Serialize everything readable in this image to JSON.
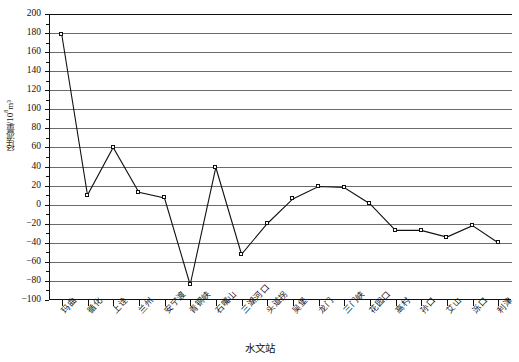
{
  "chart_data": {
    "type": "line",
    "title": "",
    "xlabel": "水文站",
    "ylabel": "径流量/10⁸m³",
    "ylabel_base": "径流量/10",
    "ylabel_exp": "8",
    "ylabel_unit": "m³",
    "ylim": [
      -100,
      200
    ],
    "ytick_step": 20,
    "ytick_labels": [
      "200",
      "180",
      "160",
      "140",
      "120",
      "100",
      "80",
      "60",
      "40",
      "20",
      "0",
      "−20",
      "−40",
      "−60",
      "−80",
      "−100"
    ],
    "grid": true,
    "legend": "none",
    "marker": "open-square",
    "line_color": "#111111",
    "grid_color": "#6b6b6b",
    "categories": [
      "玛曲",
      "循化",
      "上诠",
      "兰州",
      "安宁渡",
      "青铜峡",
      "石嘴山",
      "三湖河口",
      "头道拐",
      "吴堡",
      "龙门",
      "三门峡",
      "花园口",
      "高村",
      "孙口",
      "艾山",
      "泺口",
      "利津"
    ],
    "values": [
      178,
      10,
      60,
      13,
      7,
      -84,
      39,
      -52,
      -20,
      6,
      19,
      18,
      1,
      -27,
      -27,
      -34,
      -22,
      -40
    ]
  }
}
